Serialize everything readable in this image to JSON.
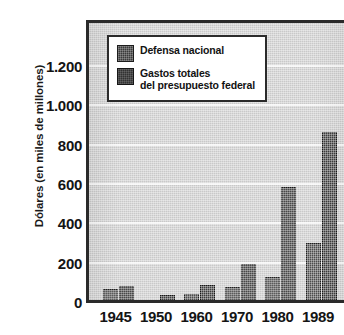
{
  "chart_data": {
    "type": "bar",
    "title": "",
    "subtitle": "",
    "xlabel": "",
    "ylabel": "Dólares (en miles de millones)",
    "categories": [
      "1945",
      "1950",
      "1960",
      "1970",
      "1980",
      "1989"
    ],
    "series": [
      {
        "name": "Defensa nacional",
        "values": [
          73,
          13,
          48,
          82,
          134,
          304
        ],
        "color": "#383838"
      },
      {
        "name": "Gastos totales del presupuesto federal",
        "values": [
          85,
          40,
          92,
          196,
          591,
          870
        ],
        "color": "#2e2e2e"
      }
    ],
    "legend": [
      {
        "label": "Defensa nacional",
        "line2": ""
      },
      {
        "label": "Gastos totales",
        "line2": "del presupuesto federal"
      }
    ],
    "legend_position": "top-left-inside",
    "ylim": [
      0,
      1200
    ],
    "yticks": [
      "0",
      "200",
      "400",
      "600",
      "800",
      "1.000",
      "1.200"
    ],
    "ytick_values": [
      0,
      200,
      400,
      600,
      800,
      1000,
      1200
    ],
    "grid": true,
    "grid_axis": "y",
    "plot_background_color": "#c9c9c9",
    "gridline_color": "#f4f4f4",
    "axis_color": "#2a2a2a",
    "page_background_color": "#ffffff"
  }
}
